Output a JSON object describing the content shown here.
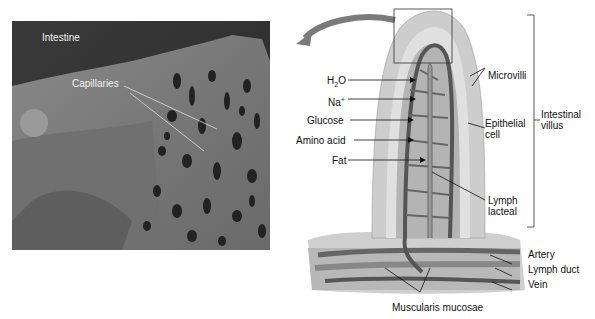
{
  "photo": {
    "labels": {
      "intestine": "Intestine",
      "capillaries": "Capillaries"
    }
  },
  "diagram": {
    "left_labels": {
      "h2o": "H2O",
      "h2o_base": "H",
      "h2o_sub": "2",
      "h2o_end": "O",
      "na_base": "Na",
      "na_sup": "+",
      "glucose": "Glucose",
      "amino_acid": "Amino acid",
      "fat": "Fat"
    },
    "right_labels": {
      "microvilli": "Microvilli",
      "epithelial_line1": "Epithelial",
      "epithelial_line2": "cell",
      "lymph_line1": "Lymph",
      "lymph_line2": "lacteal",
      "intestinal_line1": "Intestinal",
      "intestinal_line2": "villus",
      "artery": "Artery",
      "lymph_duct": "Lymph duct",
      "vein": "Vein"
    },
    "bottom_labels": {
      "muscularis": "Muscularis mucosae"
    },
    "colors": {
      "vessel": "#555555",
      "epithelium": "#c8c8c8",
      "core": "#a0a0a0",
      "arrow": "#7a7a7a"
    }
  }
}
